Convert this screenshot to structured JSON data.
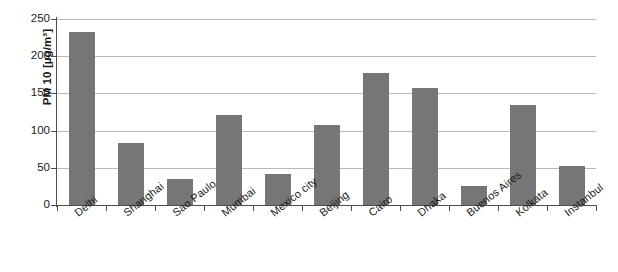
{
  "chart_data": {
    "type": "bar",
    "title": "",
    "xlabel": "",
    "ylabel": "PM 10 [µg/m³]",
    "ylim": [
      0,
      250
    ],
    "yticks": [
      0,
      50,
      100,
      150,
      200,
      250
    ],
    "ytick_labels": [
      "0",
      "50",
      "100",
      "150",
      "200",
      "250"
    ],
    "grid": true,
    "legend": null,
    "categories": [
      "Delhi",
      "Shanghai",
      "Sao Paulo",
      "Mumbai",
      "Mexico city",
      "Beijing",
      "Cairo",
      "Dhaka",
      "Buenos Aires",
      "Kolkata",
      "Instanbul"
    ],
    "values": [
      233,
      84,
      35,
      121,
      42,
      108,
      178,
      157,
      25,
      134,
      52
    ],
    "series": [
      {
        "name": "PM 10",
        "values": [
          233,
          84,
          35,
          121,
          42,
          108,
          178,
          157,
          25,
          134,
          52
        ]
      }
    ],
    "bar_color": "#767676",
    "gridline_color": "#b8b8b8",
    "axis_color": "#4d4d4d",
    "background_color": "#ffffff"
  }
}
